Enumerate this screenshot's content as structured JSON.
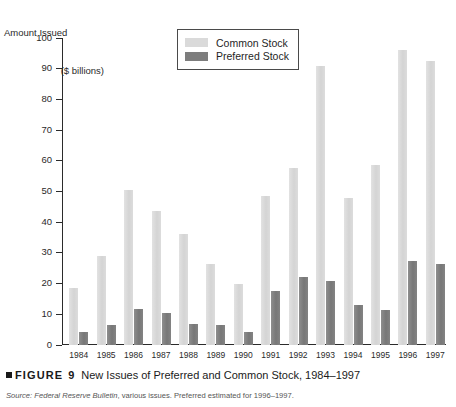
{
  "axis_title": {
    "line1": "Amount Issued",
    "line2": "($ billions)"
  },
  "legend": {
    "items": [
      {
        "label": "Common Stock",
        "color": "#dadada",
        "key": "common"
      },
      {
        "label": "Preferred Stock",
        "color": "#7d7d7d",
        "key": "preferred"
      }
    ]
  },
  "caption": {
    "marker": "square-bullet",
    "figure_word": "FIGURE",
    "figure_number": "9",
    "title": "New Issues of Preferred and Common Stock, 1984–1997"
  },
  "source": {
    "label": "Source:",
    "publication": "Federal Reserve Bulletin",
    "rest": ", various issues. Preferred estimated for 1996–1997."
  },
  "chart_data": {
    "type": "bar",
    "title": "New Issues of Preferred and Common Stock, 1984–1997",
    "xlabel": "",
    "ylabel": "Amount Issued ($ billions)",
    "ylim": [
      0,
      100
    ],
    "yticks": [
      0,
      10,
      20,
      30,
      40,
      50,
      60,
      70,
      80,
      90,
      100
    ],
    "grid": false,
    "legend_position": "top-center",
    "categories": [
      "1984",
      "1985",
      "1986",
      "1987",
      "1988",
      "1989",
      "1990",
      "1991",
      "1992",
      "1993",
      "1994",
      "1995",
      "1996",
      "1997"
    ],
    "series": [
      {
        "name": "Common Stock",
        "color": "#dadada",
        "values": [
          18.5,
          29.0,
          50.5,
          43.5,
          36.0,
          26.5,
          19.8,
          48.5,
          57.5,
          91.0,
          48.0,
          58.5,
          96.0,
          92.5
        ]
      },
      {
        "name": "Preferred Stock",
        "color": "#7d7d7d",
        "values": [
          4.2,
          6.6,
          11.6,
          10.3,
          6.9,
          6.6,
          4.4,
          17.5,
          22.0,
          21.0,
          13.0,
          11.5,
          27.5,
          26.5
        ]
      }
    ]
  }
}
